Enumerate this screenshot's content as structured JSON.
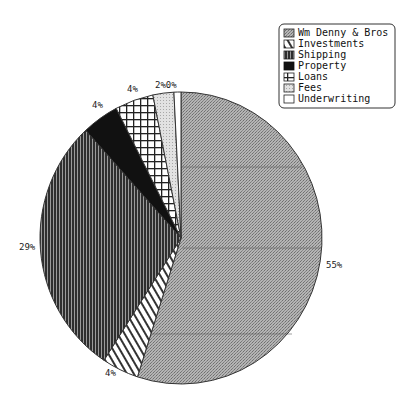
{
  "chart_data": {
    "type": "pie",
    "title": "",
    "categories": [
      "Wm Denny & Bros",
      "Investments",
      "Shipping",
      "Property",
      "Loans",
      "Fees",
      "Underwriting"
    ],
    "values": [
      55,
      4,
      29,
      4,
      4,
      2,
      0
    ],
    "value_labels": [
      "55%",
      "4%",
      "29%",
      "4%",
      "4%",
      "2%",
      "0%"
    ],
    "start_angle_deg": 0,
    "direction": "clockwise",
    "legend_position": "top-right",
    "grid": false,
    "patterns": [
      "fine-crosshatch-gray",
      "diagonal-hatch",
      "vertical-lines-dark",
      "solid-black",
      "grid",
      "light-dots",
      "white"
    ]
  },
  "legend": {
    "items": [
      {
        "label": "Wm Denny & Bros"
      },
      {
        "label": "Investments"
      },
      {
        "label": "Shipping"
      },
      {
        "label": "Property"
      },
      {
        "label": "Loans"
      },
      {
        "label": "Fees"
      },
      {
        "label": "Underwriting"
      }
    ]
  },
  "labels": {
    "wm_denny": "55%",
    "investments": "4%",
    "shipping": "29%",
    "property": "4%",
    "loans": "4%",
    "fees_underwriting": "2%0%"
  }
}
